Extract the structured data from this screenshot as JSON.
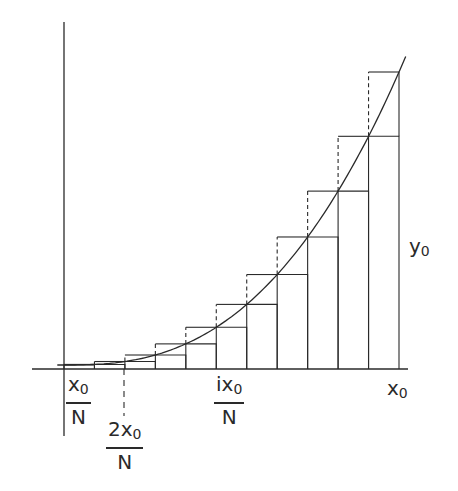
{
  "figure": {
    "n_intervals": 11,
    "line_color": "#2a2a2a",
    "labels": {
      "first_tick": {
        "numerator": "x",
        "numerator_sub": "0",
        "denominator": "N"
      },
      "second_tick": {
        "numerator": "2x",
        "numerator_sub": "0",
        "denominator": "N"
      },
      "ith_tick": {
        "numerator": "ix",
        "numerator_sub": "0",
        "denominator": "N"
      },
      "x_end": {
        "text": "x",
        "sub": "0"
      },
      "y_end": {
        "text": "y",
        "sub": "0"
      }
    }
  }
}
